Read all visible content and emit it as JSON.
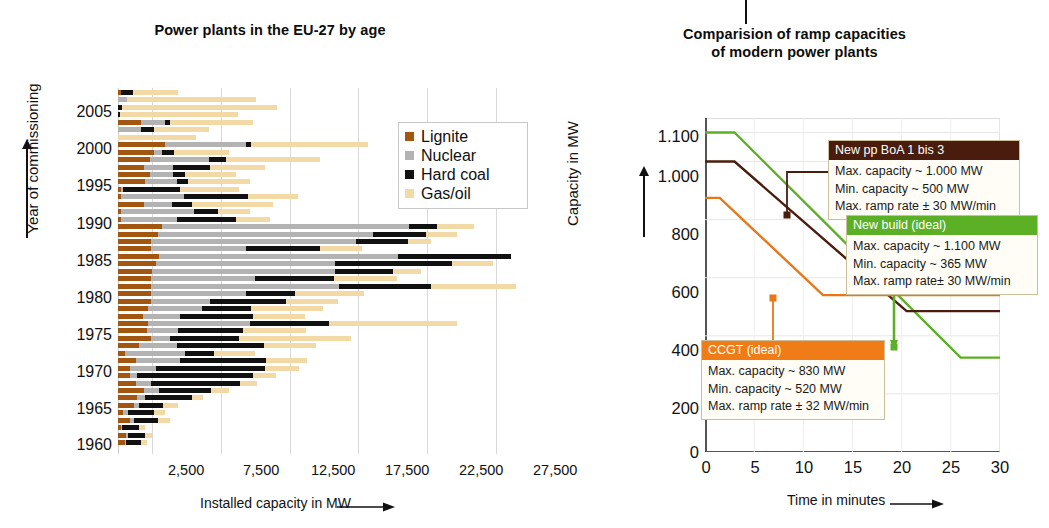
{
  "figure": {
    "background": "#ffffff",
    "divider_tick": true
  },
  "left": {
    "title": "Power plants in the EU-27 by age",
    "ylabel": "Year of commissioning",
    "xlabel": "Installed capacity in MW",
    "x_ticks": [
      "2,500",
      "7,500",
      "12,500",
      "17,500",
      "22,500",
      "27,500"
    ],
    "y_ticks": [
      "2005",
      "2000",
      "1995",
      "1990",
      "1985",
      "1980",
      "1975",
      "1970",
      "1965",
      "1960"
    ],
    "legend": [
      {
        "label": "Lignite",
        "color": "#a3560f"
      },
      {
        "label": "Nuclear",
        "color": "#b3b3b3"
      },
      {
        "label": "Hard coal",
        "color": "#111111"
      },
      {
        "label": "Gas/oil",
        "color": "#f2d9a6"
      }
    ]
  },
  "right": {
    "title_line1": "Comparision of ramp capacities",
    "title_line2": "of modern power plants",
    "ylabel": "Capacity in MW",
    "xlabel": "Time in minutes",
    "y_ticks": [
      "1.100",
      "1.000",
      "800",
      "600",
      "400",
      "200",
      "0"
    ],
    "x_ticks": [
      "0",
      "5",
      "10",
      "15",
      "20",
      "25",
      "30"
    ],
    "callouts": [
      {
        "id": "boa",
        "header": "New pp BoA 1 bis 3",
        "header_color": "#4a1c0d",
        "lines": [
          "Max. capacity ~ 1.000 MW",
          "Min. capacity ~ 500 MW",
          "Max. ramp rate ± 30 MW/min"
        ]
      },
      {
        "id": "newbuild",
        "header": "New build (ideal)",
        "header_color": "#5cb025",
        "lines": [
          "Max. capacity ~ 1.100 MW",
          "Min. capacity ~ 365 MW",
          "Max. ramp rate± 30 MW/min"
        ]
      },
      {
        "id": "ccgt",
        "header": "CCGT (ideal)",
        "header_color": "#ef7c17",
        "lines": [
          "Max. capacity ~ 830 MW",
          "Min. capacity ~ 520 MW",
          "Max. ramp rate ± 32 MW/min"
        ]
      }
    ]
  },
  "chart_data": [
    {
      "type": "bar",
      "orientation": "horizontal",
      "stacked": true,
      "title": "Power plants in the EU-27 by age",
      "xlabel": "Installed capacity in MW",
      "ylabel": "Year of commissioning",
      "xlim": [
        0,
        30000
      ],
      "xticks": [
        2500,
        7500,
        12500,
        17500,
        22500,
        27500
      ],
      "ylim": [
        1957,
        2008
      ],
      "yticks": [
        1960,
        1965,
        1970,
        1975,
        1980,
        1985,
        1990,
        1995,
        2000,
        2005
      ],
      "grid": "vertical",
      "legend_position": "upper-right",
      "series_order": [
        "Lignite",
        "Nuclear",
        "Hard coal",
        "Gas/oil"
      ],
      "series_colors": {
        "Lignite": "#a3560f",
        "Nuclear": "#b3b3b3",
        "Hard coal": "#111111",
        "Gas/oil": "#f2d9a6"
      },
      "rows": [
        {
          "year": 2007,
          "Lignite": 200,
          "Nuclear": 0,
          "Hard coal": 900,
          "Gas/oil": 3300
        },
        {
          "year": 2006,
          "Lignite": 0,
          "Nuclear": 650,
          "Hard coal": 0,
          "Gas/oil": 9400
        },
        {
          "year": 2005,
          "Lignite": 0,
          "Nuclear": 0,
          "Hard coal": 300,
          "Gas/oil": 11300
        },
        {
          "year": 2004,
          "Lignite": 0,
          "Nuclear": 0,
          "Hard coal": 150,
          "Gas/oil": 8600
        },
        {
          "year": 2003,
          "Lignite": 1700,
          "Nuclear": 1700,
          "Hard coal": 400,
          "Gas/oil": 6000
        },
        {
          "year": 2002,
          "Lignite": 0,
          "Nuclear": 1700,
          "Hard coal": 900,
          "Gas/oil": 4000
        },
        {
          "year": 2001,
          "Lignite": 0,
          "Nuclear": 0,
          "Hard coal": 0,
          "Gas/oil": 5700
        },
        {
          "year": 2000,
          "Lignite": 3400,
          "Nuclear": 5900,
          "Hard coal": 400,
          "Gas/oil": 8500
        },
        {
          "year": 1999,
          "Lignite": 2600,
          "Nuclear": 600,
          "Hard coal": 900,
          "Gas/oil": 4000
        },
        {
          "year": 1998,
          "Lignite": 2300,
          "Nuclear": 4300,
          "Hard coal": 1300,
          "Gas/oil": 6800
        },
        {
          "year": 1997,
          "Lignite": 1900,
          "Nuclear": 2100,
          "Hard coal": 2700,
          "Gas/oil": 4000
        },
        {
          "year": 1996,
          "Lignite": 2300,
          "Nuclear": 1700,
          "Hard coal": 900,
          "Gas/oil": 3700
        },
        {
          "year": 1995,
          "Lignite": 2000,
          "Nuclear": 2300,
          "Hard coal": 800,
          "Gas/oil": 4500
        },
        {
          "year": 1994,
          "Lignite": 200,
          "Nuclear": 200,
          "Hard coal": 4100,
          "Gas/oil": 4300
        },
        {
          "year": 1993,
          "Lignite": 200,
          "Nuclear": 4600,
          "Hard coal": 4700,
          "Gas/oil": 3600
        },
        {
          "year": 1992,
          "Lignite": 1900,
          "Nuclear": 2000,
          "Hard coal": 1500,
          "Gas/oil": 5900
        },
        {
          "year": 1991,
          "Lignite": 200,
          "Nuclear": 5300,
          "Hard coal": 1800,
          "Gas/oil": 2300
        },
        {
          "year": 1990,
          "Lignite": 200,
          "Nuclear": 4100,
          "Hard coal": 4300,
          "Gas/oil": 2500
        },
        {
          "year": 1989,
          "Lignite": 3200,
          "Nuclear": 18000,
          "Hard coal": 2000,
          "Gas/oil": 2700
        },
        {
          "year": 1988,
          "Lignite": 2900,
          "Nuclear": 15700,
          "Hard coal": 3800,
          "Gas/oil": 2300
        },
        {
          "year": 1987,
          "Lignite": 2400,
          "Nuclear": 14900,
          "Hard coal": 3800,
          "Gas/oil": 1700
        },
        {
          "year": 1986,
          "Lignite": 2400,
          "Nuclear": 6900,
          "Hard coal": 5400,
          "Gas/oil": 3100
        },
        {
          "year": 1985,
          "Lignite": 3000,
          "Nuclear": 17400,
          "Hard coal": 8200,
          "Gas/oil": 0
        },
        {
          "year": 1984,
          "Lignite": 2800,
          "Nuclear": 13000,
          "Hard coal": 8500,
          "Gas/oil": 3000
        },
        {
          "year": 1983,
          "Lignite": 2500,
          "Nuclear": 13300,
          "Hard coal": 4200,
          "Gas/oil": 2100
        },
        {
          "year": 1982,
          "Lignite": 2400,
          "Nuclear": 7600,
          "Hard coal": 5700,
          "Gas/oil": 4600
        },
        {
          "year": 1981,
          "Lignite": 2400,
          "Nuclear": 13700,
          "Hard coal": 6700,
          "Gas/oil": 6200
        },
        {
          "year": 1980,
          "Lignite": 2400,
          "Nuclear": 6900,
          "Hard coal": 3600,
          "Gas/oil": 5000
        },
        {
          "year": 1979,
          "Lignite": 2400,
          "Nuclear": 4300,
          "Hard coal": 5500,
          "Gas/oil": 3800
        },
        {
          "year": 1978,
          "Lignite": 2200,
          "Nuclear": 3900,
          "Hard coal": 3600,
          "Gas/oil": 5200
        },
        {
          "year": 1977,
          "Lignite": 1800,
          "Nuclear": 2700,
          "Hard coal": 5300,
          "Gas/oil": 3800
        },
        {
          "year": 1976,
          "Lignite": 2200,
          "Nuclear": 7400,
          "Hard coal": 5800,
          "Gas/oil": 9300
        },
        {
          "year": 1975,
          "Lignite": 2100,
          "Nuclear": 2300,
          "Hard coal": 4700,
          "Gas/oil": 4600
        },
        {
          "year": 1974,
          "Lignite": 2400,
          "Nuclear": 1400,
          "Hard coal": 5000,
          "Gas/oil": 8200
        },
        {
          "year": 1973,
          "Lignite": 1500,
          "Nuclear": 2800,
          "Hard coal": 6300,
          "Gas/oil": 3800
        },
        {
          "year": 1972,
          "Lignite": 500,
          "Nuclear": 4400,
          "Hard coal": 2100,
          "Gas/oil": 3000
        },
        {
          "year": 1971,
          "Lignite": 1300,
          "Nuclear": 3200,
          "Hard coal": 6300,
          "Gas/oil": 3000
        },
        {
          "year": 1970,
          "Lignite": 900,
          "Nuclear": 1900,
          "Hard coal": 7900,
          "Gas/oil": 2500
        },
        {
          "year": 1969,
          "Lignite": 900,
          "Nuclear": 500,
          "Hard coal": 8400,
          "Gas/oil": 1700
        },
        {
          "year": 1968,
          "Lignite": 1300,
          "Nuclear": 1100,
          "Hard coal": 6500,
          "Gas/oil": 1200
        },
        {
          "year": 1967,
          "Lignite": 1900,
          "Nuclear": 1100,
          "Hard coal": 3800,
          "Gas/oil": 1300
        },
        {
          "year": 1966,
          "Lignite": 1400,
          "Nuclear": 600,
          "Hard coal": 3400,
          "Gas/oil": 800
        },
        {
          "year": 1965,
          "Lignite": 1200,
          "Nuclear": 300,
          "Hard coal": 1800,
          "Gas/oil": 1100
        },
        {
          "year": 1964,
          "Lignite": 400,
          "Nuclear": 300,
          "Hard coal": 1900,
          "Gas/oil": 800
        },
        {
          "year": 1963,
          "Lignite": 900,
          "Nuclear": 300,
          "Hard coal": 1700,
          "Gas/oil": 900
        },
        {
          "year": 1962,
          "Lignite": 200,
          "Nuclear": 100,
          "Hard coal": 1200,
          "Gas/oil": 500
        },
        {
          "year": 1961,
          "Lignite": 600,
          "Nuclear": 100,
          "Hard coal": 1300,
          "Gas/oil": 500
        },
        {
          "year": 1960,
          "Lignite": 500,
          "Nuclear": 100,
          "Hard coal": 1100,
          "Gas/oil": 400
        }
      ]
    },
    {
      "type": "line",
      "title": "Comparision of ramp capacities of modern power plants",
      "xlabel": "Time in minutes",
      "ylabel": "Capacity in MW",
      "xlim": [
        0,
        30
      ],
      "ylim": [
        0,
        1150
      ],
      "xticks": [
        0,
        5,
        10,
        15,
        20,
        25,
        30
      ],
      "yticks": [
        0,
        200,
        400,
        600,
        800,
        1000,
        1100
      ],
      "grid": "horizontal",
      "legend_position": "callout-boxes",
      "series": [
        {
          "name": "New build (ideal)",
          "color": "#5cb025",
          "points": [
            [
              0,
              1100
            ],
            [
              3,
              1100
            ],
            [
              26,
              325
            ],
            [
              30,
              325
            ]
          ],
          "marker": {
            "x": 24,
            "y": 390
          }
        },
        {
          "name": "New pp BoA 1 bis 3",
          "color": "#4a1c0d",
          "points": [
            [
              0,
              1000
            ],
            [
              3,
              1000
            ],
            [
              20.5,
              485
            ],
            [
              30,
              485
            ]
          ],
          "marker": {
            "x": 8,
            "y": 855
          }
        },
        {
          "name": "CCGT (ideal)",
          "color": "#e8771a",
          "points": [
            [
              0,
              875
            ],
            [
              1.5,
              875
            ],
            [
              12,
              540
            ],
            [
              30,
              540
            ]
          ],
          "marker": {
            "x": 8.8,
            "y": 630
          }
        }
      ]
    }
  ]
}
